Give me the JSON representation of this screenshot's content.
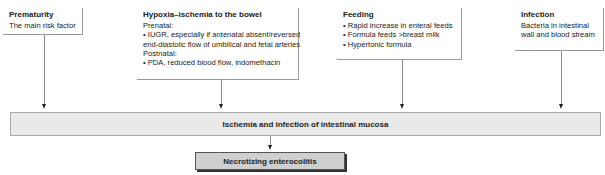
{
  "boxes": {
    "prematurity": {
      "title": "Prematurity",
      "lines": [
        "The main risk factor"
      ]
    },
    "hypoxia": {
      "title": "Hypoxia–ischemia to the bowel",
      "lines": [
        "Prenatal:",
        "• IUGR, especially if antenatal absent/reversed",
        "end-diastolic flow of umbilical and fetal arteries",
        "Postnatal:",
        "• PDA, reduced blood flow, indomethacin"
      ]
    },
    "feeding": {
      "title": "Feeding",
      "lines": [
        "• Rapid increase in enteral feeds",
        "• Formula feeds >breast milk",
        "• Hypertonic formula"
      ]
    },
    "infection": {
      "title": "Infection",
      "lines": [
        "Bacteria in intestinal",
        "wall and blood stream"
      ]
    }
  },
  "central": {
    "label": "Ischemia and infection of intestinal mucosa"
  },
  "outcome": {
    "label": "Necrotizing enterocolitis"
  }
}
